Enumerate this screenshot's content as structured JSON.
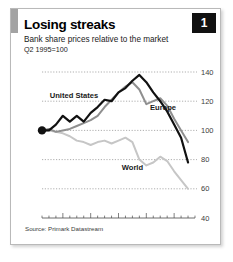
{
  "figure": {
    "title": "Losing streaks",
    "subtitle_line1": "Bank share prices relative to the market",
    "subtitle_line2": "Q2 1995=100",
    "badge": "1",
    "source": "Source: Primark Datastream"
  },
  "chart_data": {
    "type": "line",
    "title": "Losing streaks",
    "subtitle": "Bank share prices relative to the market",
    "xlabel": "",
    "ylabel": "Q2 1995=100",
    "ylim": [
      40,
      140
    ],
    "yticks": [
      40,
      60,
      80,
      100,
      120,
      140
    ],
    "xlim": [
      1995.25,
      2000.75
    ],
    "xticks": [
      1995,
      1996,
      1997,
      1998,
      1999,
      2000
    ],
    "xticklabels": [
      "1995",
      "96",
      "97",
      "98",
      "99",
      "2000"
    ],
    "grid": true,
    "legend": "inline-labels",
    "marker_note": "Filled black dot marks the Q2 1995 = 100 base point on the United States series",
    "x": [
      1995.25,
      1995.5,
      1995.75,
      1996.0,
      1996.25,
      1996.5,
      1996.75,
      1997.0,
      1997.25,
      1997.5,
      1997.75,
      1998.0,
      1998.25,
      1998.5,
      1998.75,
      1999.0,
      1999.25,
      1999.5,
      1999.75,
      2000.0,
      2000.25,
      2000.5
    ],
    "series": [
      {
        "name": "United States",
        "color": "#111111",
        "width": 2.2,
        "label_x": 1996.4,
        "label_y": 122,
        "values": [
          100,
          100,
          104,
          110,
          106,
          110,
          106,
          112,
          116,
          121,
          120,
          126,
          129,
          134,
          138,
          133,
          126,
          120,
          113,
          104,
          95,
          78
        ]
      },
      {
        "name": "Europe",
        "color": "#8f8f8f",
        "width": 2.0,
        "label_x": 1999.6,
        "label_y": 114,
        "values": [
          100,
          101,
          99,
          100,
          101,
          103,
          105,
          107,
          110,
          116,
          121,
          126,
          130,
          133,
          128,
          118,
          120,
          122,
          117,
          108,
          100,
          92
        ]
      },
      {
        "name": "World",
        "color": "#c6c6c6",
        "width": 2.0,
        "label_x": 1998.5,
        "label_y": 73,
        "values": [
          100,
          100,
          99,
          98,
          96,
          93,
          92,
          90,
          92,
          93,
          91,
          93,
          95,
          92,
          80,
          76,
          78,
          82,
          79,
          72,
          66,
          60
        ]
      }
    ]
  }
}
